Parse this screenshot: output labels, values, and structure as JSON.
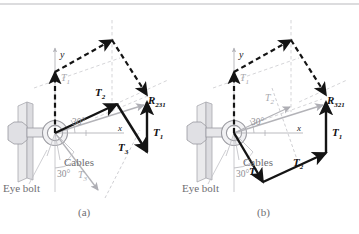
{
  "figure": {
    "type": "vector-polygon-diagram",
    "top_rule_color": "#b9b9bd",
    "colors": {
      "solid_vector": "#141414",
      "dashed_vector": "#141414",
      "gray_line": "#b3b3b8",
      "gray_label": "#a9a9ae",
      "angle_label": "#8d8d93",
      "hardware_fill": "#e3e3e6",
      "hardware_stroke": "#9a9aa0",
      "caption": "#6e6e72",
      "background": "#ffffff"
    },
    "panels": [
      {
        "id": "a",
        "caption": "(a)",
        "resultant_label": "R",
        "resultant_subscript": "231",
        "axis_labels": {
          "x": "x",
          "y": "y"
        },
        "angle_upper": "30°",
        "angle_lower": "30°",
        "callouts": {
          "eye_bolt": "Eye bolt",
          "cables": "Cables"
        },
        "vectors": [
          {
            "name": "T",
            "sub": "1",
            "style": "dashed",
            "role": "parallelogram-first"
          },
          {
            "name": "T",
            "sub": "2",
            "style": "solid",
            "role": "chain-first"
          },
          {
            "name": "T",
            "sub": "3",
            "style": "solid",
            "role": "chain-second"
          },
          {
            "name": "T",
            "sub": "1",
            "style": "solid",
            "role": "chain-third"
          },
          {
            "name": "T",
            "sub": "3",
            "style": "gray",
            "role": "cable-direction"
          }
        ]
      },
      {
        "id": "b",
        "caption": "(b)",
        "resultant_label": "R",
        "resultant_subscript": "321",
        "axis_labels": {
          "x": "x",
          "y": "y"
        },
        "angle_upper": "30°",
        "angle_lower": "30°",
        "callouts": {
          "eye_bolt": "Eye bolt",
          "cables": "Cables"
        },
        "vectors": [
          {
            "name": "T",
            "sub": "1",
            "style": "dashed",
            "role": "parallelogram-first"
          },
          {
            "name": "T",
            "sub": "3",
            "style": "solid",
            "role": "chain-first"
          },
          {
            "name": "T",
            "sub": "2",
            "style": "solid",
            "role": "chain-second"
          },
          {
            "name": "T",
            "sub": "1",
            "style": "solid",
            "role": "chain-third"
          },
          {
            "name": "T",
            "sub": "2",
            "style": "gray",
            "role": "cable-direction"
          }
        ]
      }
    ]
  }
}
